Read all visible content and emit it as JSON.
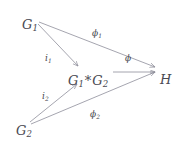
{
  "figure": {
    "type": "commutative-diagram",
    "background_color": "#ffffff",
    "ink_color": "#4a4a52",
    "arrow_color": "#8e8e9a"
  },
  "nodes": [
    {
      "id": "G1",
      "label_base": "G",
      "label_sub": "1",
      "full": "G1",
      "x": 22,
      "y": 18
    },
    {
      "id": "G2",
      "label_base": "G",
      "label_sub": "2",
      "full": "G2",
      "x": 16,
      "y": 124
    },
    {
      "id": "Gstar",
      "label_base": "G",
      "label_sub": "1",
      "operator": "*",
      "label_base2": "G",
      "label_sub2": "2",
      "full": "G1 * G2",
      "x": 68,
      "y": 74
    },
    {
      "id": "H",
      "label_base": "H",
      "label_sub": "",
      "full": "H",
      "x": 160,
      "y": 73
    }
  ],
  "edges": [
    {
      "id": "i1",
      "from": "G1",
      "to": "Gstar",
      "label_base": "i",
      "label_sub": "1",
      "full": "i1",
      "label_x": 45,
      "label_y": 54
    },
    {
      "id": "i2",
      "from": "G2",
      "to": "Gstar",
      "label_base": "i",
      "label_sub": "2",
      "full": "i2",
      "label_x": 42,
      "label_y": 92
    },
    {
      "id": "phi1",
      "from": "G1",
      "to": "H",
      "label_base": "ϕ",
      "label_sub": "1",
      "full": "ϕ1",
      "label_x": 92,
      "label_y": 29
    },
    {
      "id": "phi2",
      "from": "G2",
      "to": "H",
      "label_base": "ϕ",
      "label_sub": "2",
      "full": "ϕ2",
      "label_x": 90,
      "label_y": 110
    },
    {
      "id": "phi",
      "from": "Gstar",
      "to": "H",
      "label_base": "ϕ",
      "label_sub": "",
      "full": "ϕ",
      "label_x": 125,
      "label_y": 54
    }
  ]
}
